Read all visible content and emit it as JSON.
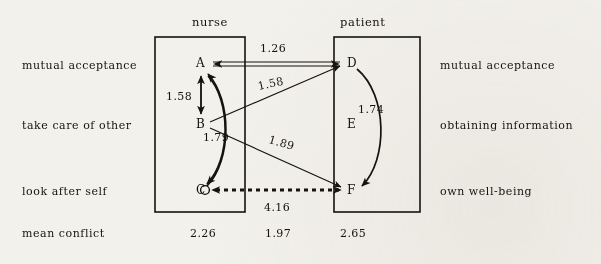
{
  "diagram": {
    "groups": [
      {
        "id": "nurse",
        "label": "nurse"
      },
      {
        "id": "patient",
        "label": "patient"
      }
    ],
    "left_labels": [
      {
        "id": "mutual-acceptance",
        "text": "mutual acceptance"
      },
      {
        "id": "take-care-of-other",
        "text": "take care of other"
      },
      {
        "id": "look-after-self",
        "text": "look after self"
      },
      {
        "id": "mean-conflict",
        "text": "mean conflict"
      }
    ],
    "right_labels": [
      {
        "id": "mutual-acceptance",
        "text": "mutual acceptance"
      },
      {
        "id": "obtaining-information",
        "text": "obtaining information"
      },
      {
        "id": "own-well-being",
        "text": "own well-being"
      }
    ],
    "nodes": [
      {
        "id": "A",
        "label": "A",
        "group": "nurse",
        "x": 200,
        "y": 64
      },
      {
        "id": "B",
        "label": "B",
        "group": "nurse",
        "x": 200,
        "y": 124
      },
      {
        "id": "C",
        "label": "C",
        "group": "nurse",
        "x": 200,
        "y": 190
      },
      {
        "id": "D",
        "label": "D",
        "group": "patient",
        "x": 348,
        "y": 64
      },
      {
        "id": "E",
        "label": "E",
        "group": "patient",
        "x": 348,
        "y": 124
      },
      {
        "id": "F",
        "label": "F",
        "group": "patient",
        "x": 348,
        "y": 190
      }
    ],
    "edges": [
      {
        "id": "A-D",
        "from": "A",
        "to": "D",
        "value": "1.26",
        "style": "double-line",
        "heads": "both"
      },
      {
        "id": "A-B",
        "from": "A",
        "to": "B",
        "value": "1.58",
        "style": "solid",
        "heads": "both"
      },
      {
        "id": "B-D",
        "from": "B",
        "to": "D",
        "value": "1.58",
        "style": "solid",
        "heads": "to"
      },
      {
        "id": "A-C",
        "from": "A",
        "to": "C",
        "value": "1.79",
        "style": "curved",
        "heads": "both"
      },
      {
        "id": "B-F",
        "from": "B",
        "to": "F",
        "value": "1.89",
        "style": "solid",
        "heads": "to"
      },
      {
        "id": "D-F",
        "from": "D",
        "to": "F",
        "value": "1.74",
        "style": "curved",
        "heads": "to"
      },
      {
        "id": "C-F",
        "from": "C",
        "to": "F",
        "value": "4.16",
        "style": "dashed",
        "heads": "both"
      }
    ],
    "mean_conflict_values": [
      {
        "id": "nurse",
        "value": "2.26"
      },
      {
        "id": "between",
        "value": "1.97"
      },
      {
        "id": "patient",
        "value": "2.65"
      }
    ],
    "colors": {
      "ink": "#16130f",
      "paper": "#f3f1ec"
    }
  }
}
